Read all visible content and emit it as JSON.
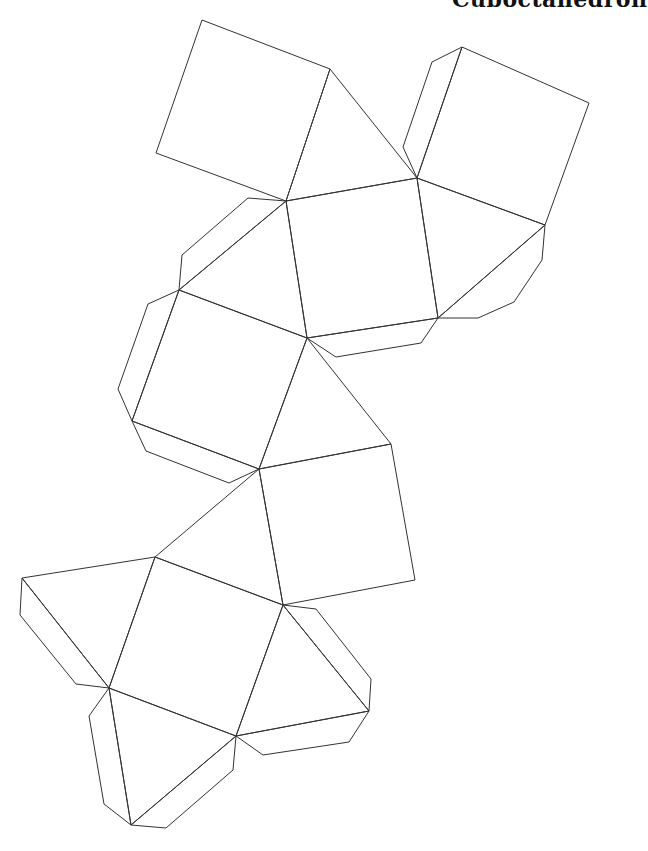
{
  "title": "Cuboctahedron",
  "stroke_color": "#333333",
  "faces": [
    {
      "type": "square",
      "points": "202,20 330,69 286,201 156,153"
    },
    {
      "type": "triangle",
      "points": "330,69 417,178 286,201"
    },
    {
      "type": "square",
      "points": "462,47 589,103 545,225 417,178"
    },
    {
      "type": "square",
      "points": "286,201 417,178 438,318 307,338"
    },
    {
      "type": "triangle",
      "points": "417,178 545,225 438,318"
    },
    {
      "type": "triangle",
      "points": "286,201 307,338 179,290"
    },
    {
      "type": "square",
      "points": "179,290 307,338 259,469 132,421"
    },
    {
      "type": "triangle",
      "points": "307,338 391,444 259,469"
    },
    {
      "type": "square",
      "points": "259,469 391,444 415,580 283,605"
    },
    {
      "type": "triangle",
      "points": "259,469 283,605 155,557"
    },
    {
      "type": "triangle",
      "points": "155,557 22,578 109,688"
    },
    {
      "type": "square",
      "points": "155,557 283,605 236,736 109,688"
    },
    {
      "type": "triangle",
      "points": "283,605 369,711 236,736"
    },
    {
      "type": "triangle",
      "points": "109,688 236,736 131,825"
    }
  ],
  "tabs": [
    {
      "points": "462,47 432,62 403,147 417,178"
    },
    {
      "points": "545,225 542,260 514,302 478,318 438,318"
    },
    {
      "points": "286,201 248,198 182,255 179,290"
    },
    {
      "points": "307,338 438,318 421,343 336,357"
    },
    {
      "points": "179,290 148,304 118,389 132,421"
    },
    {
      "points": "132,421 146,451 229,483 259,469"
    },
    {
      "points": "22,578 20,615 76,684 109,688"
    },
    {
      "points": "283,605 316,609 371,679 369,711"
    },
    {
      "points": "236,736 263,755 349,742 369,711"
    },
    {
      "points": "109,688 89,716 104,804 131,825"
    },
    {
      "points": "236,736 233,770 166,828 131,825"
    }
  ]
}
